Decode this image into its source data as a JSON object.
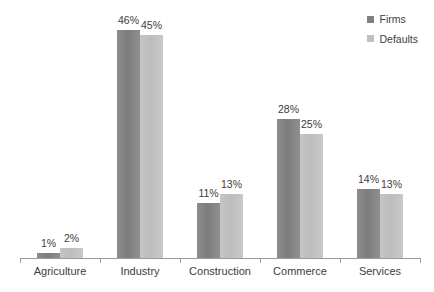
{
  "chart_data": {
    "type": "bar",
    "title": "",
    "subtitle": "",
    "xlabel": "",
    "ylabel": "",
    "ylim": [
      0,
      50
    ],
    "grid": false,
    "legend_position": "top-right",
    "value_suffix": "%",
    "categories": [
      "Agriculture",
      "Industry",
      "Construction",
      "Commerce",
      "Services"
    ],
    "series": [
      {
        "name": "Firms",
        "color": "#808080",
        "values": [
          1,
          46,
          11,
          28,
          14
        ],
        "labels": [
          "1%",
          "46%",
          "11%",
          "28%",
          "14%"
        ]
      },
      {
        "name": "Defaults",
        "color": "#bfbfbf",
        "values": [
          2,
          45,
          13,
          25,
          13
        ],
        "labels": [
          "2%",
          "45%",
          "13%",
          "25%",
          "13%"
        ]
      }
    ]
  },
  "legend": {
    "entries": [
      {
        "label": "Firms",
        "swatch": "#808080",
        "icon": "square-swatch-icon"
      },
      {
        "label": "Defaults",
        "swatch": "#bfbfbf",
        "icon": "square-swatch-icon"
      }
    ]
  },
  "axis": {
    "baseline_color": "#9a9a9a",
    "tick_count": 6
  }
}
